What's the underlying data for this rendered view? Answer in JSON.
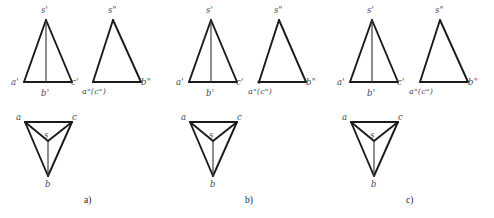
{
  "figure": {
    "kind": "descriptive-geometry-orthographic-projection",
    "background_color": "#ffffff",
    "line_color": "#1a1a1a",
    "label_color": "#4a4a52",
    "panels": [
      {
        "id": "a",
        "caption": "a)",
        "caption_pos": {
          "x": 84,
          "y": 196
        },
        "front_view": {
          "name": "V-projection",
          "apex": {
            "x": 46,
            "y": 20
          },
          "base_left": {
            "x": 24,
            "y": 82
          },
          "base_right": {
            "x": 72,
            "y": 82
          },
          "base_mid": {
            "x": 46,
            "y": 82
          },
          "labels": [
            {
              "text": "s'",
              "x": 41,
              "y": 6
            },
            {
              "text": "a'",
              "x": 11,
              "y": 78
            },
            {
              "text": "b'",
              "x": 41,
              "y": 89
            },
            {
              "text": "c'",
              "x": 71,
              "y": 78
            }
          ]
        },
        "side_view": {
          "name": "W-projection",
          "apex": {
            "x": 113,
            "y": 20
          },
          "base_left": {
            "x": 93,
            "y": 82
          },
          "base_right": {
            "x": 141,
            "y": 82
          },
          "labels": [
            {
              "text": "s\"",
              "x": 108,
              "y": 6
            },
            {
              "text": "a\"(c\")",
              "x": 82,
              "y": 88
            },
            {
              "text": "b\"",
              "x": 141,
              "y": 78
            }
          ]
        },
        "top_view": {
          "name": "H-projection",
          "a": {
            "x": 25,
            "y": 122
          },
          "c": {
            "x": 72,
            "y": 122
          },
          "b": {
            "x": 48,
            "y": 176
          },
          "s": {
            "x": 48,
            "y": 141
          },
          "labels": [
            {
              "text": "a",
              "x": 16,
              "y": 113
            },
            {
              "text": "c",
              "x": 72,
              "y": 113
            },
            {
              "text": "b",
              "x": 45,
              "y": 180
            },
            {
              "text": "s",
              "x": 44,
              "y": 131
            }
          ]
        }
      },
      {
        "id": "b",
        "caption": "b)",
        "caption_pos": {
          "x": 245,
          "y": 196
        },
        "front_view": {
          "name": "V-projection",
          "apex": {
            "x": 211,
            "y": 20
          },
          "base_left": {
            "x": 189,
            "y": 82
          },
          "base_right": {
            "x": 237,
            "y": 82
          },
          "base_mid": {
            "x": 211,
            "y": 82
          },
          "labels": [
            {
              "text": "s'",
              "x": 206,
              "y": 6
            },
            {
              "text": "a'",
              "x": 176,
              "y": 78
            },
            {
              "text": "b'",
              "x": 206,
              "y": 89
            },
            {
              "text": "c'",
              "x": 236,
              "y": 78
            }
          ]
        },
        "side_view": {
          "name": "W-projection",
          "apex": {
            "x": 279,
            "y": 20
          },
          "base_left": {
            "x": 259,
            "y": 82
          },
          "base_right": {
            "x": 306,
            "y": 82
          },
          "labels": [
            {
              "text": "s\"",
              "x": 274,
              "y": 6
            },
            {
              "text": "a\"(c\")",
              "x": 248,
              "y": 88
            },
            {
              "text": "b\"",
              "x": 306,
              "y": 78
            }
          ]
        },
        "top_view": {
          "name": "H-projection",
          "a": {
            "x": 190,
            "y": 122
          },
          "c": {
            "x": 237,
            "y": 122
          },
          "b": {
            "x": 213,
            "y": 176
          },
          "s": {
            "x": 213,
            "y": 141
          },
          "labels": [
            {
              "text": "a",
              "x": 181,
              "y": 113
            },
            {
              "text": "c",
              "x": 237,
              "y": 113
            },
            {
              "text": "b",
              "x": 210,
              "y": 180
            },
            {
              "text": "s",
              "x": 209,
              "y": 131
            }
          ]
        }
      },
      {
        "id": "c",
        "caption": "c)",
        "caption_pos": {
          "x": 406,
          "y": 196
        },
        "front_view": {
          "name": "V-projection",
          "apex": {
            "x": 372,
            "y": 20
          },
          "base_left": {
            "x": 350,
            "y": 82
          },
          "base_right": {
            "x": 398,
            "y": 82
          },
          "base_mid": {
            "x": 372,
            "y": 82
          },
          "labels": [
            {
              "text": "s'",
              "x": 367,
              "y": 6
            },
            {
              "text": "a'",
              "x": 337,
              "y": 78
            },
            {
              "text": "b'",
              "x": 367,
              "y": 89
            },
            {
              "text": "c'",
              "x": 397,
              "y": 78
            }
          ]
        },
        "side_view": {
          "name": "W-projection",
          "apex": {
            "x": 440,
            "y": 20
          },
          "base_left": {
            "x": 420,
            "y": 82
          },
          "base_right": {
            "x": 468,
            "y": 82
          },
          "labels": [
            {
              "text": "s\"",
              "x": 435,
              "y": 6
            },
            {
              "text": "a\"(c\")",
              "x": 409,
              "y": 88
            },
            {
              "text": "b\"",
              "x": 468,
              "y": 78
            }
          ]
        },
        "top_view": {
          "name": "H-projection",
          "a": {
            "x": 351,
            "y": 122
          },
          "c": {
            "x": 398,
            "y": 122
          },
          "b": {
            "x": 374,
            "y": 176
          },
          "s": {
            "x": 374,
            "y": 141
          },
          "labels": [
            {
              "text": "a",
              "x": 342,
              "y": 113
            },
            {
              "text": "c",
              "x": 398,
              "y": 113
            },
            {
              "text": "b",
              "x": 371,
              "y": 180
            },
            {
              "text": "s",
              "x": 370,
              "y": 131
            }
          ]
        }
      }
    ]
  }
}
